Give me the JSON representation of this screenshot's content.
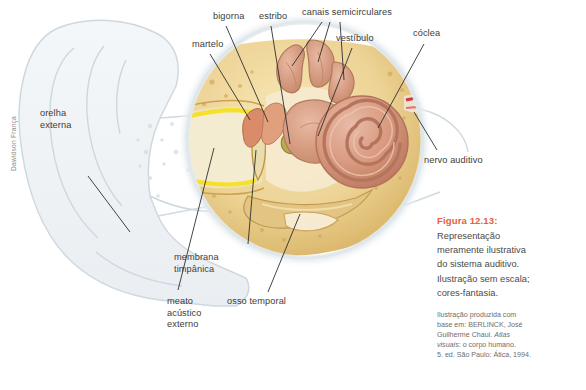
{
  "figure": {
    "illustrator_credit": "Dawidson França",
    "caption_title": "Figura 12.13:",
    "caption_body": "Representação\nmeramente ilustrativa\ndo sistema auditivo.\nIlustração sem escala;\ncores-fantasia.",
    "source_line1": "Ilustração produzida com",
    "source_line2": "base em: BERLINCK, José",
    "source_line3_pre": "Guilherme Chaui. ",
    "source_line3_italic": "Atlas",
    "source_line4_italic": "visuais",
    "source_line4_post": ": o corpo humano.",
    "source_line5": "5. ed. São Paulo: Ática, 1994."
  },
  "labels": [
    {
      "id": "bigorna",
      "text": "bigorna",
      "x": 213,
      "y": 11,
      "align": "left"
    },
    {
      "id": "estribo",
      "text": "estribo",
      "x": 259,
      "y": 11,
      "align": "left"
    },
    {
      "id": "canais-semicirculares",
      "text": "canais semicirculares",
      "x": 302,
      "y": 7,
      "align": "left"
    },
    {
      "id": "vestibulo",
      "text": "vestíbulo",
      "x": 336,
      "y": 33,
      "align": "left"
    },
    {
      "id": "coclea",
      "text": "cóclea",
      "x": 413,
      "y": 28,
      "align": "left"
    },
    {
      "id": "martelo",
      "text": "martelo",
      "x": 192,
      "y": 39,
      "align": "left"
    },
    {
      "id": "orelha-externa",
      "text": "orelha\nexterna",
      "x": 40,
      "y": 108,
      "align": "left"
    },
    {
      "id": "nervo-auditivo",
      "text": "nervo auditivo",
      "x": 424,
      "y": 155,
      "align": "left"
    },
    {
      "id": "membrana-timpanica",
      "text": "membrana\ntimpânica",
      "x": 174,
      "y": 252,
      "align": "left"
    },
    {
      "id": "osso-temporal",
      "text": "osso temporal",
      "x": 227,
      "y": 296,
      "align": "left"
    },
    {
      "id": "meato-acustico",
      "text": "meato\nacústico\nexterno",
      "x": 167,
      "y": 296,
      "align": "left"
    }
  ],
  "colors": {
    "accent": "#e8603c",
    "label_text": "#3c3c3c",
    "ghost_outline": "#c9d4db",
    "bone": "#f0d89a",
    "bone_shadow": "#c9a24e",
    "cochlea": "#dba189",
    "cochlea_dark": "#b9745c",
    "canal_yellow": "#f5e12a",
    "vessel_red": "#c8403c",
    "background": "#ffffff"
  }
}
